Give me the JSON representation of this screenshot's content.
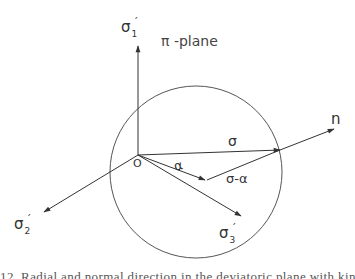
{
  "diagram": {
    "plane_label": "π -plane",
    "axes": {
      "sigma1": {
        "symbol": "σ",
        "subscript": "1",
        "prime": "´"
      },
      "sigma2": {
        "symbol": "σ",
        "subscript": "2",
        "prime": "´"
      },
      "sigma3": {
        "symbol": "σ",
        "subscript": "3",
        "prime": "´"
      }
    },
    "origin_label": "O",
    "vectors": {
      "sigma": "σ",
      "alpha": "α",
      "sigma_minus_alpha": "σ-α",
      "normal": "n"
    },
    "colors": {
      "line": "#333333",
      "background": "#ffffff"
    }
  },
  "caption": {
    "text": "12.  Radial and normal direction in the deviatoric plane with kinematic hardening"
  }
}
